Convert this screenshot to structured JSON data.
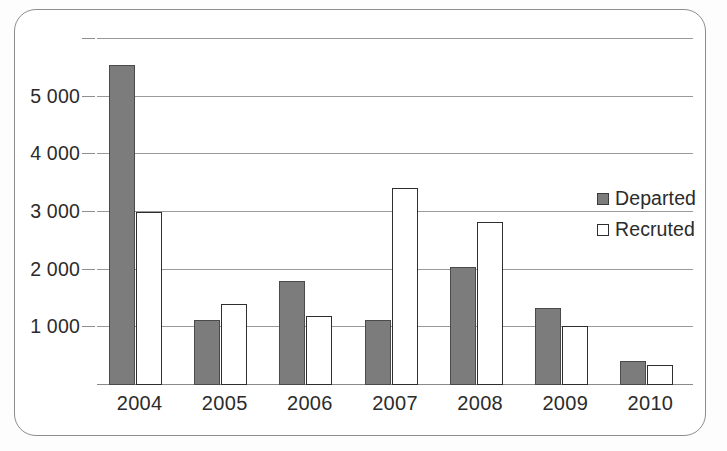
{
  "chart_data": {
    "type": "bar",
    "title": "",
    "xlabel": "",
    "ylabel": "",
    "categories": [
      "2004",
      "2005",
      "2006",
      "2007",
      "2008",
      "2009",
      "2010"
    ],
    "series": [
      {
        "name": "Departed",
        "color": "#7c7c7c",
        "values": [
          5550,
          1120,
          1800,
          1120,
          2050,
          1340,
          420
        ]
      },
      {
        "name": "Recruted",
        "color": "#ffffff",
        "values": [
          3000,
          1400,
          1200,
          3420,
          2830,
          1030,
          350
        ]
      }
    ],
    "ylim": [
      0,
      6000
    ],
    "yticks": [
      1000,
      2000,
      3000,
      4000,
      5000,
      6000
    ],
    "ytick_labels": [
      "1 000",
      "2 000",
      "3 000",
      "4 000",
      "5 000",
      ""
    ],
    "grid": true,
    "legend_position": "right-middle"
  },
  "legend": {
    "entries": [
      {
        "label": "Departed",
        "swatch": "filled-gray-square"
      },
      {
        "label": "Recruted",
        "swatch": "outlined-white-square"
      }
    ]
  },
  "colors": {
    "departed_fill": "#7c7c7c",
    "departed_border": "#4a4a4a",
    "recruted_fill": "#ffffff",
    "recruted_border": "#2e2e2e",
    "gridline": "#9a9a9a",
    "frame_border": "#8d8d8d",
    "text": "#2b2b2b",
    "background": "#ffffff"
  }
}
